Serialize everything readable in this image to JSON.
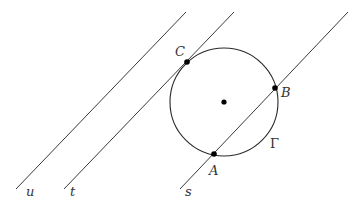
{
  "diagram": {
    "type": "geometry",
    "lines": [
      {
        "name": "u",
        "label": "u",
        "x1": 16,
        "y1": 189,
        "x2": 186,
        "y2": 12,
        "label_x": 26,
        "label_y": 196
      },
      {
        "name": "t",
        "label": "t",
        "x1": 64,
        "y1": 189,
        "x2": 234,
        "y2": 12,
        "label_x": 70,
        "label_y": 196
      },
      {
        "name": "s",
        "label": "s",
        "x1": 180,
        "y1": 189,
        "x2": 348,
        "y2": 12,
        "label_x": 185,
        "label_y": 196
      }
    ],
    "circle": {
      "name": "Gamma",
      "label": "Γ",
      "cx": 224,
      "cy": 102,
      "r": 54,
      "label_x": 270,
      "label_y": 148
    },
    "center_point": {
      "x": 224,
      "y": 102
    },
    "points": [
      {
        "name": "C",
        "label": "C",
        "x": 187,
        "y": 62,
        "label_x": 175,
        "label_y": 56
      },
      {
        "name": "B",
        "label": "B",
        "x": 275,
        "y": 88,
        "label_x": 281,
        "label_y": 97
      },
      {
        "name": "A",
        "label": "A",
        "x": 214,
        "y": 154,
        "label_x": 209,
        "label_y": 175
      }
    ],
    "colors": {
      "background": "#ffffff",
      "stroke": "#333333",
      "point": "#000000"
    }
  }
}
